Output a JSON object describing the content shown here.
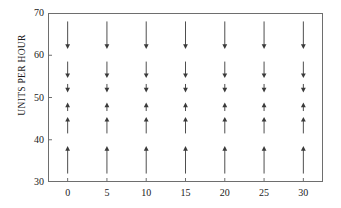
{
  "chart_data": {
    "type": "scatter",
    "title": "",
    "subtitle": "",
    "xlabel": "",
    "ylabel": "UNITS PER HOUR",
    "xlim": [
      -2.5,
      32.5
    ],
    "ylim": [
      30,
      70
    ],
    "grid": false,
    "legend": null,
    "x_ticks": [
      0,
      5,
      10,
      15,
      20,
      25,
      30
    ],
    "x_tick_labels": [
      "0",
      "5",
      "10",
      "15",
      "20",
      "25",
      "30"
    ],
    "y_ticks": [
      30,
      40,
      50,
      60,
      70
    ],
    "y_tick_labels": [
      "30",
      "40",
      "50",
      "60",
      "70"
    ],
    "equilibrium": 50,
    "arrow_color": "#3a3a3a",
    "frame_color": "#6e6e6e",
    "columns_x": [
      0,
      5,
      10,
      15,
      20,
      25,
      30
    ],
    "arrows_per_column": [
      {
        "tail_y": 68.0,
        "head_y": 61.5,
        "direction": "down"
      },
      {
        "tail_y": 58.5,
        "head_y": 54.6,
        "direction": "down"
      },
      {
        "tail_y": 53.2,
        "head_y": 51.2,
        "direction": "down"
      },
      {
        "tail_y": 46.8,
        "head_y": 48.8,
        "direction": "up"
      },
      {
        "tail_y": 41.5,
        "head_y": 45.4,
        "direction": "up"
      },
      {
        "tail_y": 32.0,
        "head_y": 38.5,
        "direction": "up"
      }
    ]
  }
}
